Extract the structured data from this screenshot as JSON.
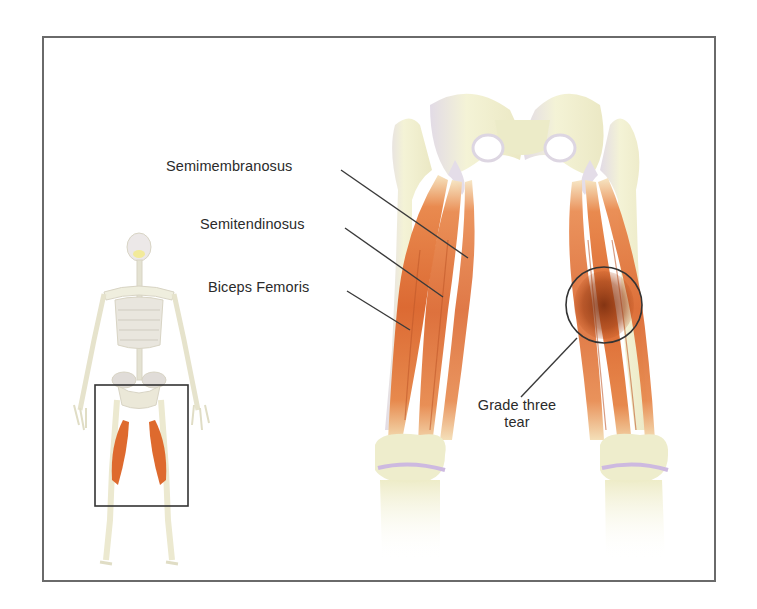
{
  "figure": {
    "labels": {
      "semimembranosus": "Semimembranosus",
      "semitendinosus": "Semitendinosus",
      "biceps_femoris": "Biceps Femoris",
      "tear_line1": "Grade three",
      "tear_line2": "tear"
    },
    "colors": {
      "muscle": "#e0703a",
      "muscle_dark": "#b5501f",
      "tear": "#8a3a14",
      "bone": "#f1f0cf",
      "bone_shade": "#d9d2e0",
      "frame": "#6a6a6a",
      "leader_line": "#3a3a3a"
    }
  }
}
